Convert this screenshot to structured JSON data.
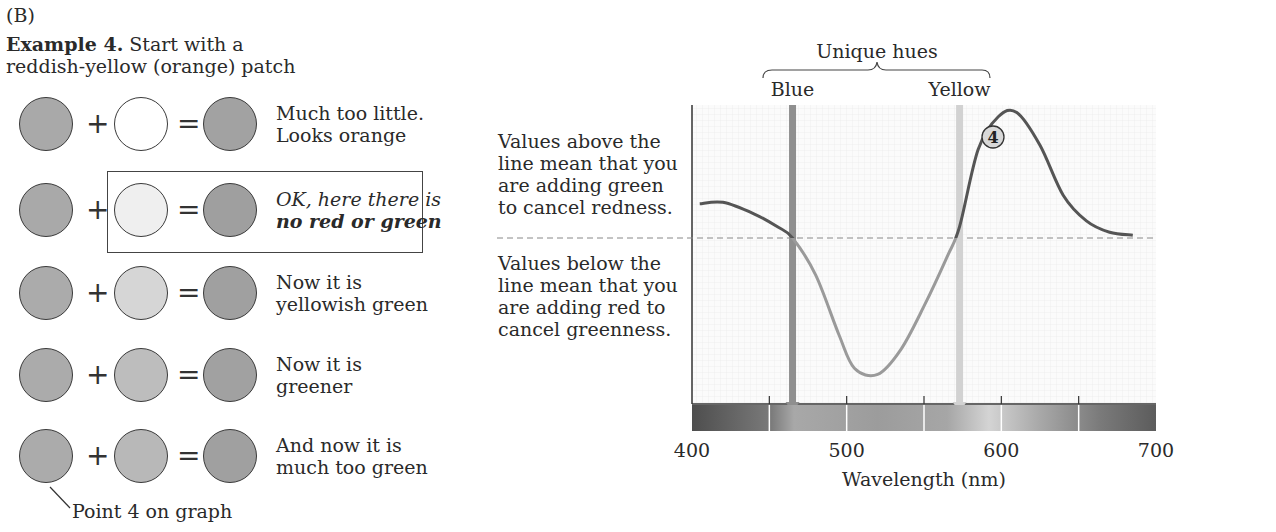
{
  "panel_label": "(B)",
  "example": {
    "title_bold": "Example 4.",
    "title_line1_rest": " Start with a",
    "title_line2": "reddish-yellow (orange) patch"
  },
  "rows": [
    {
      "base_color": "#a9a9a9",
      "added_color": "#ffffff",
      "result_color": "#a2a2a2",
      "line1": "Much too little.",
      "line2": "Looks orange",
      "style": "normal"
    },
    {
      "base_color": "#a9a9a9",
      "added_color": "#efefef",
      "result_color": "#9f9f9f",
      "line1": "OK, here there is",
      "line2": "no red or green",
      "style": "highlight"
    },
    {
      "base_color": "#ababab",
      "added_color": "#d6d6d6",
      "result_color": "#a0a0a0",
      "line1": "Now it is",
      "line2": "yellowish green",
      "style": "normal"
    },
    {
      "base_color": "#ababab",
      "added_color": "#bdbdbd",
      "result_color": "#a1a1a1",
      "line1": "Now it is",
      "line2": "greener",
      "style": "normal"
    },
    {
      "base_color": "#ababab",
      "added_color": "#b8b8b8",
      "result_color": "#a0a0a0",
      "line1": "And now it is",
      "line2": "much too green",
      "style": "normal"
    }
  ],
  "operators": {
    "plus": "+",
    "equals": "="
  },
  "callout_label": "Point 4 on graph",
  "annotations": {
    "above": [
      "Values above the",
      "line mean that you",
      "are adding green",
      "to cancel redness."
    ],
    "below": [
      "Values below the",
      "line mean that you",
      "are adding red to",
      "cancel greenness."
    ]
  },
  "chart_data": {
    "type": "line",
    "title": "Unique hues",
    "xlabel": "Wavelength (nm)",
    "ylabel": "",
    "xlim": [
      400,
      700
    ],
    "x_ticks": [
      400,
      500,
      600,
      700
    ],
    "minor_ticks": [
      450,
      500,
      550,
      600,
      650
    ],
    "grid": true,
    "zero_line": "dashed",
    "unique_hue_markers": [
      {
        "label": "Blue",
        "wavelength": 465,
        "color": "#8f8f8f"
      },
      {
        "label": "Yellow",
        "wavelength": 573,
        "color": "#d2d2d2"
      }
    ],
    "series": [
      {
        "name": "Hue cancellation (red-green)",
        "x": [
          405,
          420,
          440,
          455,
          465,
          480,
          495,
          505,
          520,
          535,
          550,
          565,
          573,
          585,
          598,
          610,
          625,
          640,
          655,
          670,
          685
        ],
        "values": [
          0.24,
          0.25,
          0.17,
          0.08,
          0.0,
          -0.3,
          -0.78,
          -1.05,
          -1.1,
          -0.9,
          -0.55,
          -0.15,
          0.08,
          0.62,
          0.85,
          0.88,
          0.65,
          0.3,
          0.12,
          0.04,
          0.02
        ]
      }
    ],
    "annotations": [
      {
        "label": "4",
        "wavelength": 593,
        "note": "Point 4 on graph"
      }
    ],
    "spectrum_bar": {
      "segments_nm": [
        [
          400,
          450
        ],
        [
          450,
          500
        ],
        [
          500,
          550
        ],
        [
          550,
          600
        ],
        [
          600,
          650
        ],
        [
          650,
          700
        ]
      ],
      "colors": [
        "#5a5a5a",
        "#a0a0a0",
        "#9a9a9a",
        "#b5b5b5",
        "#9e9e9e",
        "#6e6e6e"
      ]
    }
  }
}
